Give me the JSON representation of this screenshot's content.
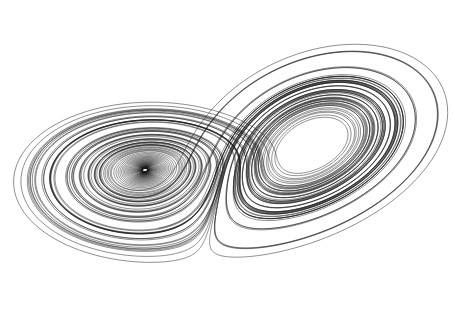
{
  "figure": {
    "subject": "Lorenz attractor",
    "background_color": "#ffffff",
    "line_color": "#1a1a1a",
    "parameters": {
      "sigma": 10,
      "rho": 28,
      "beta": 2.6667
    },
    "lobes": [
      {
        "name": "left-lobe",
        "eye_center": [
          145,
          170
        ]
      },
      {
        "name": "right-lobe",
        "eye_center": [
          312,
          145
        ]
      }
    ]
  }
}
